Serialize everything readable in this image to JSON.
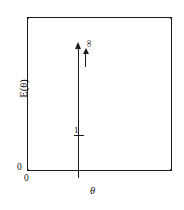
{
  "figure": {
    "title": "",
    "axes": {
      "y_label": "E(θ)",
      "x_label": "θ",
      "y_origin_label": "0",
      "x_origin_label": "0"
    },
    "annotations": {
      "infinity_symbol": "∞",
      "unit_amplitude_label": "1",
      "x_tick_label": "1"
    }
  },
  "chart_data": {
    "type": "line",
    "title": "",
    "xlabel": "θ",
    "ylabel": "E(θ)",
    "xlim": [
      0,
      2.87
    ],
    "ylim": [
      0,
      1.0
    ],
    "grid": false,
    "legend": null,
    "series": [
      {
        "name": "impulse",
        "kind": "vertical-arrow",
        "x": 1,
        "y_start": 0,
        "y_end": 1.0,
        "arrow": true,
        "label": "∞"
      }
    ],
    "tick_marks": {
      "x": [
        {
          "value": 0,
          "label": "0"
        },
        {
          "value": 1,
          "label": "1"
        }
      ],
      "y": [
        {
          "value": 0,
          "label": "0"
        },
        {
          "value": 0.237,
          "label": "1"
        }
      ]
    },
    "annotations": [
      {
        "text": "∞",
        "x": 1.08,
        "y": 0.84,
        "rotation": -90
      },
      {
        "text": "1",
        "x": 0.95,
        "y": 0.28
      }
    ],
    "colors": {
      "line": "#1a1a1a",
      "frame": "#1a1a1a",
      "background": "#ffffff"
    }
  }
}
